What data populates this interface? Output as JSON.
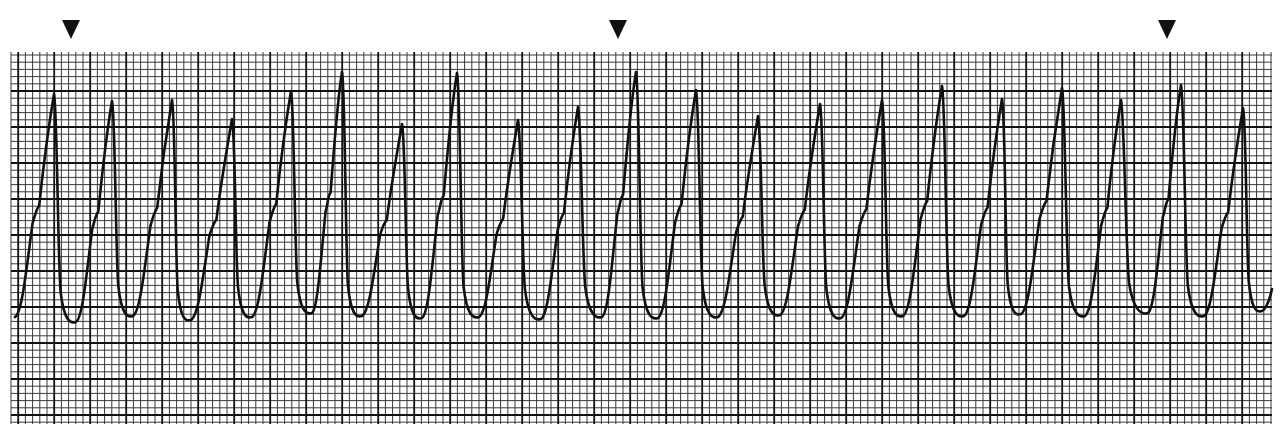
{
  "chart_data": {
    "type": "line",
    "xlabel": "",
    "ylabel": "",
    "grid": true,
    "legend": null,
    "grid_spec": {
      "left": 11,
      "top": 52,
      "right": 1272,
      "bottom": 424,
      "minor_px": 7.2,
      "major_every": 5,
      "minor_color": "#3a3a3a",
      "major_color": "#111111",
      "paper_color": "#ffffff"
    },
    "trace_color": "#111111",
    "markers": [
      {
        "label": "arrow-1",
        "x": 71,
        "y": 30
      },
      {
        "label": "arrow-2",
        "x": 618,
        "y": 30
      },
      {
        "label": "arrow-3",
        "x": 1167,
        "y": 30
      }
    ],
    "complexes": {
      "peaks": [
        [
          54,
          94
        ],
        [
          112,
          101
        ],
        [
          172,
          100
        ],
        [
          232,
          119
        ],
        [
          291,
          91
        ],
        [
          342,
          72
        ],
        [
          402,
          124
        ],
        [
          457,
          73
        ],
        [
          518,
          120
        ],
        [
          578,
          107
        ],
        [
          636,
          72
        ],
        [
          696,
          90
        ],
        [
          758,
          116
        ],
        [
          820,
          104
        ],
        [
          882,
          100
        ],
        [
          942,
          86
        ],
        [
          1002,
          99
        ],
        [
          1062,
          88
        ],
        [
          1121,
          100
        ],
        [
          1181,
          85
        ],
        [
          1243,
          108
        ]
      ],
      "troughs": [
        [
          15,
          317
        ],
        [
          76,
          322
        ],
        [
          133,
          316
        ],
        [
          191,
          320
        ],
        [
          252,
          317
        ],
        [
          312,
          313
        ],
        [
          362,
          316
        ],
        [
          422,
          318
        ],
        [
          479,
          317
        ],
        [
          541,
          319
        ],
        [
          602,
          317
        ],
        [
          658,
          318
        ],
        [
          718,
          317
        ],
        [
          780,
          315
        ],
        [
          841,
          318
        ],
        [
          903,
          316
        ],
        [
          964,
          316
        ],
        [
          1021,
          314
        ],
        [
          1085,
          316
        ],
        [
          1148,
          313
        ],
        [
          1204,
          316
        ],
        [
          1262,
          311
        ]
      ]
    },
    "beat_count": 21,
    "rhythm": "regular, wide QRS, rate approx 250 bpm"
  }
}
